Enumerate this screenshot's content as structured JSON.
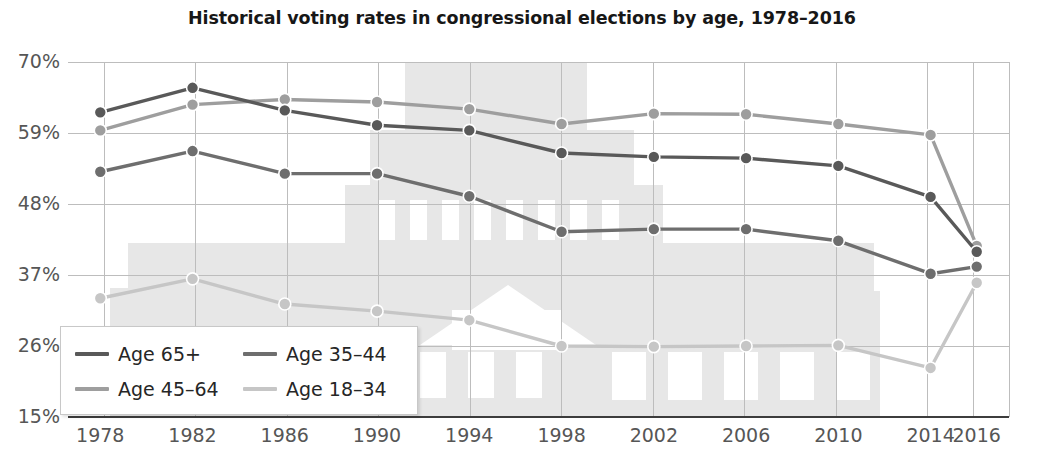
{
  "chart_data": {
    "type": "line",
    "title": "Historical voting rates in congressional elections by age, 1978–2016",
    "xlabel": "",
    "ylabel": "",
    "categories": [
      "1978",
      "1982",
      "1986",
      "1990",
      "1994",
      "1998",
      "2002",
      "2006",
      "2010",
      "2014",
      "2016"
    ],
    "x_values": [
      1978,
      1982,
      1986,
      1990,
      1994,
      1998,
      2002,
      2006,
      2010,
      2014,
      2016
    ],
    "xlim": [
      1976.6,
      2017.4
    ],
    "ylim": [
      15,
      70
    ],
    "ytick_labels": [
      "15%",
      "26%",
      "37%",
      "48%",
      "59%",
      "70%"
    ],
    "ytick_values": [
      15,
      26,
      37,
      48,
      59,
      70
    ],
    "xtick_labels": [
      "1978",
      "1982",
      "1986",
      "1990",
      "1994",
      "1998",
      "2002",
      "2006",
      "2010",
      "2014",
      "2016"
    ],
    "grid": true,
    "legend_position": "lower-left",
    "unit": "%",
    "series": [
      {
        "name": "Age 65+",
        "color": "#595959",
        "values": [
          62.2,
          66.0,
          62.5,
          60.2,
          59.4,
          55.9,
          55.3,
          55.1,
          53.9,
          49.1,
          40.6
        ]
      },
      {
        "name": "Age 45–64",
        "color": "#9e9e9e",
        "values": [
          59.4,
          63.4,
          64.2,
          63.8,
          62.7,
          60.4,
          62.0,
          61.9,
          60.4,
          58.7,
          41.5
        ]
      },
      {
        "name": "Age 35–44",
        "color": "#6e6e6e",
        "values": [
          53.0,
          56.2,
          52.7,
          52.7,
          49.2,
          43.7,
          44.1,
          44.1,
          42.3,
          37.2,
          38.3
        ]
      },
      {
        "name": "Age 18–34",
        "color": "#c6c6c6",
        "values": [
          33.4,
          36.4,
          32.5,
          31.4,
          30.0,
          26.0,
          25.9,
          26.0,
          26.1,
          22.6,
          35.8
        ]
      }
    ],
    "legend_order": [
      "Age 65+",
      "Age 35–44",
      "Age 45–64",
      "Age 18–34"
    ],
    "background_watermark": "capitol-building-silhouette",
    "colors": {
      "grid": "#bdbdbd",
      "axis": "#4a4a4a",
      "tick_text": "#565656",
      "title_text": "#171717",
      "watermark": "#e6e6e6",
      "plot_background": "#ffffff"
    }
  }
}
